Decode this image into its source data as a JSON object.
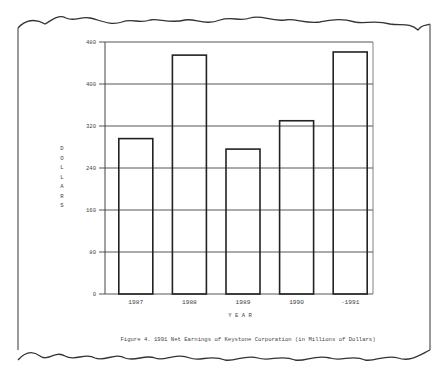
{
  "chart_data": {
    "type": "bar",
    "title": "Figure 4.  1991 Net Earnings of Keystone Corporation (in Millions of Dollars)",
    "xlabel": "Y E A R",
    "ylabel": "DOLLARS",
    "categories": [
      "1987",
      "1988",
      "1989",
      "1990",
      "·1991"
    ],
    "values": [
      296,
      455,
      276,
      330,
      461
    ],
    "ylim": [
      0,
      480
    ],
    "yticks": [
      0,
      80,
      160,
      240,
      320,
      400,
      480
    ],
    "grid": true,
    "legend": "none"
  },
  "caption": "Figure 4.  1991 Net Earnings of Keystone Corporation (in Millions of Dollars)",
  "xlabel": "Y E A R",
  "ylabel_letters": [
    "D",
    "O",
    "L",
    "L",
    "A",
    "R",
    "S"
  ],
  "yticks": [
    "480",
    "400",
    "320",
    "240",
    "160",
    "80",
    "0"
  ],
  "categories": [
    "1987",
    "1988",
    "1989",
    "1990",
    "·1991"
  ]
}
